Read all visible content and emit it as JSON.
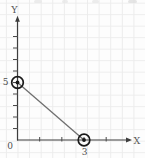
{
  "chart_data": {
    "type": "line",
    "title": "",
    "xlabel": "X",
    "ylabel": "Y",
    "x": [
      0,
      3
    ],
    "y": [
      5,
      0
    ],
    "points": [
      {
        "x": 0,
        "y": 5,
        "marker": "circled-dot"
      },
      {
        "x": 3,
        "y": 0,
        "marker": "circled-dot"
      }
    ],
    "intercepts": {
      "y_intercept": [
        0,
        5
      ],
      "x_intercept": [
        3,
        0
      ]
    },
    "axis_tick_positions": {
      "x": [
        1,
        2,
        3,
        4
      ],
      "y": [
        1,
        2,
        3,
        4,
        5,
        6,
        7,
        8,
        9
      ]
    },
    "labeled_ticks": {
      "origin": "0",
      "y": [
        {
          "value": 5,
          "label": "5"
        }
      ],
      "x": [
        {
          "value": 3,
          "label": "3"
        }
      ]
    },
    "xlim": [
      0,
      5.1
    ],
    "ylim": [
      0,
      10.4
    ],
    "grid": true,
    "legend": "none"
  },
  "colors": {
    "background": "#fdfdfd",
    "grid": "#ececec",
    "axis": "#3d3d3d",
    "tick": "#4a4a4a",
    "data_line": "#6f6f6f",
    "marker": "#1a1a1a",
    "label_text": "#5a5a5a"
  }
}
